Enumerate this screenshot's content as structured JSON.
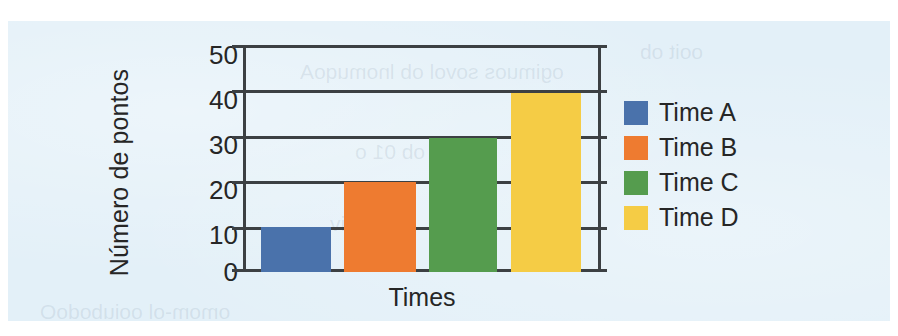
{
  "page": {
    "background_color": "#e3f0f8",
    "outer_background_color": "#ffffff"
  },
  "chart_data": {
    "type": "bar",
    "title": "",
    "xlabel": "Times",
    "ylabel": "Número de pontos",
    "categories": [
      "Time A",
      "Time B",
      "Time C",
      "Time D"
    ],
    "values": [
      10,
      20,
      30,
      40
    ],
    "colors": [
      "#4a72ab",
      "#ee7b30",
      "#559c4e",
      "#f5cc45"
    ],
    "ylim": [
      0,
      50
    ],
    "yticks": [
      0,
      10,
      20,
      30,
      40,
      50
    ],
    "ytick_labels": [
      "0",
      "10",
      "20",
      "30",
      "40",
      "50"
    ],
    "grid": true,
    "grid_axis": "y",
    "grid_color": "#3c4043",
    "legend_position": "right",
    "legend": [
      {
        "label": "Time A",
        "color": "#4a72ab",
        "value": 10
      },
      {
        "label": "Time B",
        "color": "#ee7b30",
        "value": 20
      },
      {
        "label": "Time C",
        "color": "#559c4e",
        "value": 30
      },
      {
        "label": "Time D",
        "color": "#f5cc45",
        "value": 40
      }
    ]
  }
}
